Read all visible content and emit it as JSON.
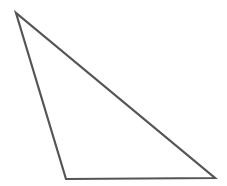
{
  "diagram": {
    "type": "triangle",
    "canvas": {
      "width": 227,
      "height": 186,
      "background": "#ffffff"
    },
    "shape": {
      "vertices": [
        {
          "name": "top-left",
          "x": 16,
          "y": 13
        },
        {
          "name": "bottom-left",
          "x": 66,
          "y": 179
        },
        {
          "name": "bottom-right",
          "x": 215,
          "y": 178
        }
      ],
      "stroke": "#555555",
      "stroke_width": 2.2,
      "fill": "none"
    }
  }
}
